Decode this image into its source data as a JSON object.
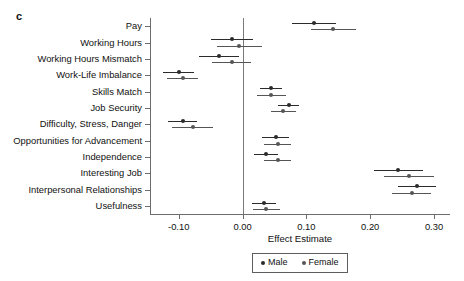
{
  "panel": {
    "label": "c"
  },
  "legend": {
    "position": "bottom-center",
    "entries": [
      {
        "name": "Male",
        "color": "#2b2b2b"
      },
      {
        "name": "Female",
        "color": "#555555"
      }
    ]
  },
  "axes": {
    "xlabel": "Effect Estimate",
    "ylabel": "",
    "xticks": [
      "-0.10",
      "0.00",
      "0.10",
      "0.20",
      "0.30"
    ],
    "xtick_values": [
      -0.1,
      0.0,
      0.1,
      0.2,
      0.3
    ],
    "xlim": [
      -0.145,
      0.325
    ],
    "zero_reference_line": 0.0,
    "grid": false
  },
  "chart_data": {
    "type": "scatter",
    "title": "",
    "xlabel": "Effect Estimate",
    "ylabel": "",
    "xlim": [
      -0.145,
      0.325
    ],
    "grid": false,
    "legend_position": "bottom-center",
    "orientation": "horizontal-forest-plot",
    "categories": [
      "Pay",
      "Working Hours",
      "Working Hours Mismatch",
      "Work-Life Imbalance",
      "Skills Match",
      "Job Security",
      "Difficulty, Stress, Danger",
      "Opportunities for Advancement",
      "Independence",
      "Interesting Job",
      "Interpersonal Relationships",
      "Usefulness"
    ],
    "series": [
      {
        "name": "Male",
        "color": "#2b2b2b",
        "values": [
          0.112,
          -0.017,
          -0.037,
          -0.1,
          0.045,
          0.072,
          -0.094,
          0.052,
          0.037,
          0.244,
          0.273,
          0.034
        ],
        "ci_low": [
          0.077,
          -0.05,
          -0.068,
          -0.124,
          0.028,
          0.055,
          -0.117,
          0.031,
          0.018,
          0.206,
          0.243,
          0.015
        ],
        "ci_high": [
          0.147,
          0.016,
          -0.006,
          -0.076,
          0.062,
          0.089,
          -0.071,
          0.073,
          0.056,
          0.282,
          0.303,
          0.053
        ]
      },
      {
        "name": "Female",
        "color": "#555555",
        "values": [
          0.142,
          -0.005,
          -0.017,
          -0.094,
          0.045,
          0.064,
          -0.078,
          0.055,
          0.055,
          0.261,
          0.265,
          0.037
        ],
        "ci_low": [
          0.107,
          -0.04,
          -0.048,
          -0.118,
          0.022,
          0.044,
          -0.11,
          0.034,
          0.034,
          0.222,
          0.234,
          0.016
        ],
        "ci_high": [
          0.177,
          0.03,
          0.014,
          -0.07,
          0.068,
          0.084,
          -0.046,
          0.076,
          0.076,
          0.3,
          0.296,
          0.058
        ]
      }
    ]
  }
}
